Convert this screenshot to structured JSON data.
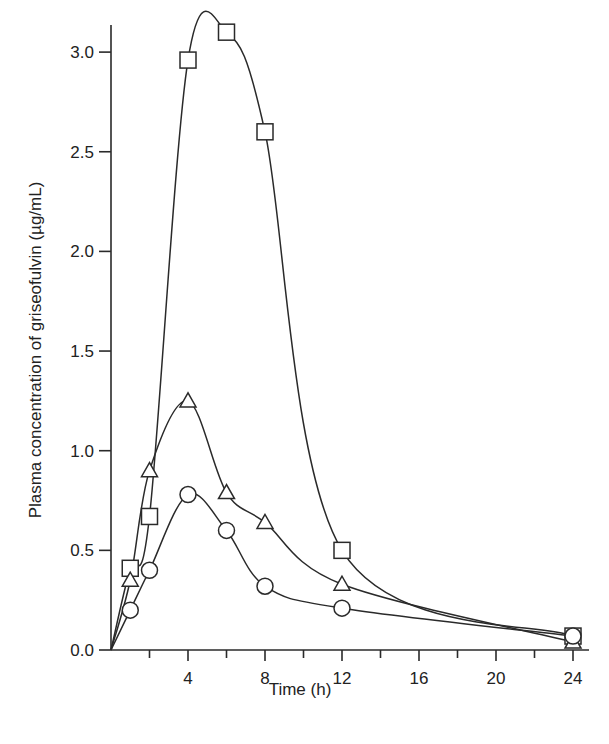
{
  "chart_data": {
    "type": "line",
    "title": "",
    "xlabel": "Time (h)",
    "ylabel": "Plasma concentration of griseofulvin (µg/mL)",
    "xlim": [
      0,
      24.5
    ],
    "ylim": [
      0,
      3.15
    ],
    "x_ticks_major": [
      4,
      8,
      12,
      16,
      20,
      24
    ],
    "x_ticks_minor": [
      2,
      6,
      10,
      14,
      18,
      22
    ],
    "x_tick_labels": [
      "4",
      "8",
      "12",
      "16",
      "20",
      "24"
    ],
    "y_ticks": [
      0.0,
      0.5,
      1.0,
      1.5,
      2.0,
      2.5,
      3.0
    ],
    "y_tick_labels": [
      "0.0",
      "0.5",
      "1.0",
      "1.5",
      "2.0",
      "2.5",
      "3.0"
    ],
    "grid": false,
    "legend": null,
    "x": [
      0,
      1,
      2,
      4,
      6,
      8,
      12,
      24
    ],
    "series": [
      {
        "name": "Square markers",
        "marker": "square",
        "values": [
          0.0,
          0.41,
          0.67,
          2.96,
          3.1,
          2.6,
          0.5,
          0.07
        ]
      },
      {
        "name": "Triangle markers",
        "marker": "triangle",
        "values": [
          0.0,
          0.35,
          0.9,
          1.25,
          0.79,
          0.64,
          0.33,
          0.04
        ]
      },
      {
        "name": "Circle markers",
        "marker": "circle",
        "values": [
          0.0,
          0.2,
          0.4,
          0.78,
          0.6,
          0.32,
          0.21,
          0.07
        ]
      }
    ]
  }
}
